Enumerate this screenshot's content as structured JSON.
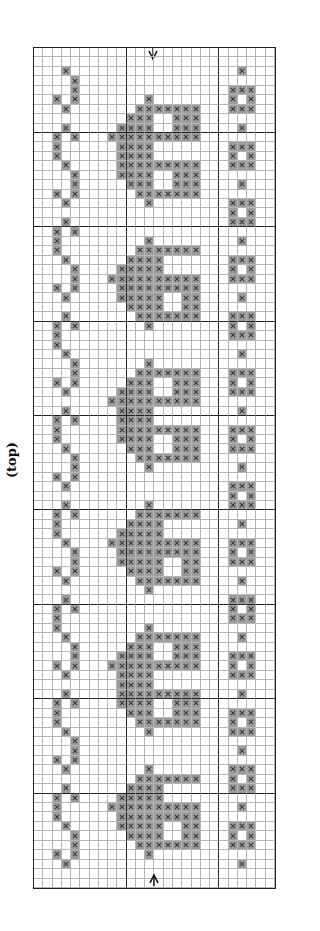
{
  "label": "(top)",
  "chart_data": {
    "type": "cross-stitch-chart",
    "columns": 26,
    "rows": 89,
    "major_grid_every": 10,
    "major_col_lines": [
      10,
      20
    ],
    "major_row_lines": [
      9,
      19,
      29,
      39,
      49,
      59,
      69,
      79
    ],
    "center_arrow_column_line": 13,
    "colors": {
      "stitch_fill": "#9c9c9c",
      "stitch_mark": "#3a3a3a",
      "grid_minor": "#b4b4b4",
      "grid_major": "#222222",
      "background": "#ffffff"
    },
    "rows_data": [
      "",
      "",
      "3,22",
      "4",
      "4,21,22,23",
      "2,4,12,21,23",
      "3,11-17,21-23",
      "10-12,15-17",
      "3,9-12,15-17,22",
      "2,4,8-17",
      "2,9-12,21-23",
      "2,9-12,21,23",
      "3,9-17,21-23",
      "4,9-12,15-17",
      "4,10-12,15-17,22",
      "2,4,11-17",
      "3,12,21-23",
      "21,23",
      "3,21-23",
      "2,4",
      "2,12,22",
      "2,11-17",
      "3,10-13,21-23",
      "4,9-13,21,23",
      "4,8-17,21-23",
      "2,4,9-17",
      "3,9-13,16,17,22",
      "10-13,16,17",
      "3,11-17,21-23",
      "2,4,12,21,23",
      "2,21-23",
      "2",
      "3,22",
      "4,12",
      "4,11-17,21-23",
      "2,4,10-12,15-17,21,23",
      "3,9-12,15-17,21-23",
      "8-17",
      "3,9-12,22",
      "2,4,9-12",
      "2,9-17,21-23",
      "2,9-12,15-17,21,23",
      "3,10-12,15-17,21-23",
      "4,11-17",
      "4,12,22",
      "2,4",
      "3,21-23",
      "21,23",
      "3,12,21-23",
      "2,4,11-17",
      "2,10-13,22",
      "2,9-13",
      "3,8-17,21-23",
      "4,9-17,21,23",
      "4,9-13,16,17,21-23",
      "2,4,10-13,16,17",
      "3,11-17,22",
      "12",
      "3,21-23",
      "2,4,21,23",
      "2,21-23",
      "2,12",
      "3,11-17,22",
      "4,10-12,15-17",
      "4,9-12,15-17,21-23",
      "2,4,8-17,21,23",
      "3,9-12,21-23",
      "9-12",
      "3,9-17,22",
      "2,4,9-12,15-17",
      "2,10-12,15-17,21-23",
      "2,11-17,21,23",
      "3,12,21-23",
      "4",
      "4,22",
      "2,4",
      "3,12,21-23",
      "11-17,21,23",
      "3,10-13,21-23",
      "2,4,9-13",
      "2,8-17,22",
      "2,9-17",
      "3,9-13,16,17,21-23",
      "4,10-13,16,17,21,23",
      "4,11-17,21-23",
      "2,4,12",
      "3,22",
      "",
      ""
    ]
  },
  "icons": {
    "top_arrow": "arrow-down-icon",
    "bottom_arrow": "arrow-up-icon"
  }
}
